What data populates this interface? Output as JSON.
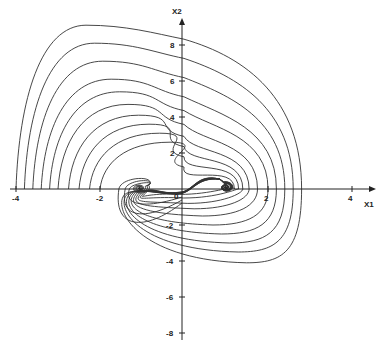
{
  "chart_data": {
    "type": "line",
    "title": "",
    "subtitle": "Phase portrait (trajectories spiraling into two stable foci)",
    "xlabel": "X1",
    "ylabel": "X2",
    "xlim": [
      -4,
      4.5
    ],
    "ylim": [
      -8,
      9.5
    ],
    "x_ticks": [
      -4,
      -2,
      2,
      4
    ],
    "x_tick_labels": [
      "-4",
      "-2",
      "2",
      "4"
    ],
    "y_ticks": [
      8,
      6,
      4,
      2,
      -2,
      -4,
      -6,
      -8
    ],
    "y_tick_labels": [
      "8",
      "6",
      "4",
      "2",
      "-2",
      "-4",
      "-6",
      "-8"
    ],
    "origin_label": "0",
    "grid": false,
    "legend": null,
    "equilibria": [
      {
        "type": "stable-focus",
        "x1": -1.05,
        "x2": 0.05
      },
      {
        "type": "stable-focus",
        "x1": 1.0,
        "x2": 0.1
      },
      {
        "type": "saddle-origin",
        "x1": 0,
        "x2": 0
      }
    ],
    "series": [
      {
        "name": "trajectory-1",
        "start_x1": -4.0,
        "top_x2": 9.1,
        "right_x1": 2.8,
        "bottom_x2": -4.1,
        "focus": "right"
      },
      {
        "name": "trajectory-2",
        "start_x1": -3.8,
        "top_x2": 8.1,
        "right_x1": 2.6,
        "bottom_x2": -3.5,
        "focus": "right"
      },
      {
        "name": "trajectory-3",
        "start_x1": -3.6,
        "top_x2": 7.1,
        "right_x1": 2.4,
        "bottom_x2": -3.0,
        "focus": "right"
      },
      {
        "name": "trajectory-4",
        "start_x1": -3.4,
        "top_x2": 6.1,
        "right_x1": 2.2,
        "bottom_x2": -2.5,
        "focus": "right"
      },
      {
        "name": "trajectory-5",
        "start_x1": -3.2,
        "top_x2": 5.4,
        "right_x1": 2.0,
        "bottom_x2": -2.0,
        "focus": "right"
      },
      {
        "name": "trajectory-6",
        "start_x1": -3.0,
        "top_x2": 4.7,
        "right_x1": 1.75,
        "bottom_x2": -1.5,
        "focus": "right"
      },
      {
        "name": "trajectory-7",
        "start_x1": -2.75,
        "top_x2": 4.1,
        "right_x1": 1.55,
        "bottom_x2": -1.1,
        "focus": "right"
      },
      {
        "name": "trajectory-8",
        "start_x1": -2.5,
        "top_x2": 3.6,
        "right_x1": 1.4,
        "bottom_x2": -0.8,
        "focus": "right"
      },
      {
        "name": "trajectory-9",
        "start_x1": -2.25,
        "top_x2": 3.1,
        "right_x1": 1.3,
        "bottom_x2": -0.5,
        "focus": "right"
      },
      {
        "name": "trajectory-10",
        "start_x1": -2.0,
        "top_x2": 2.6,
        "right_x1": 1.2,
        "bottom_x2": -0.3,
        "focus": "right"
      }
    ],
    "left_basin_loops": [
      {
        "name": "left-loop-1",
        "outer_x1": -1.55,
        "bottom_x2": -2.2
      },
      {
        "name": "left-loop-2",
        "outer_x1": -1.4,
        "bottom_x2": -1.6
      },
      {
        "name": "left-loop-3",
        "outer_x1": -1.3,
        "bottom_x2": -0.9
      }
    ]
  }
}
